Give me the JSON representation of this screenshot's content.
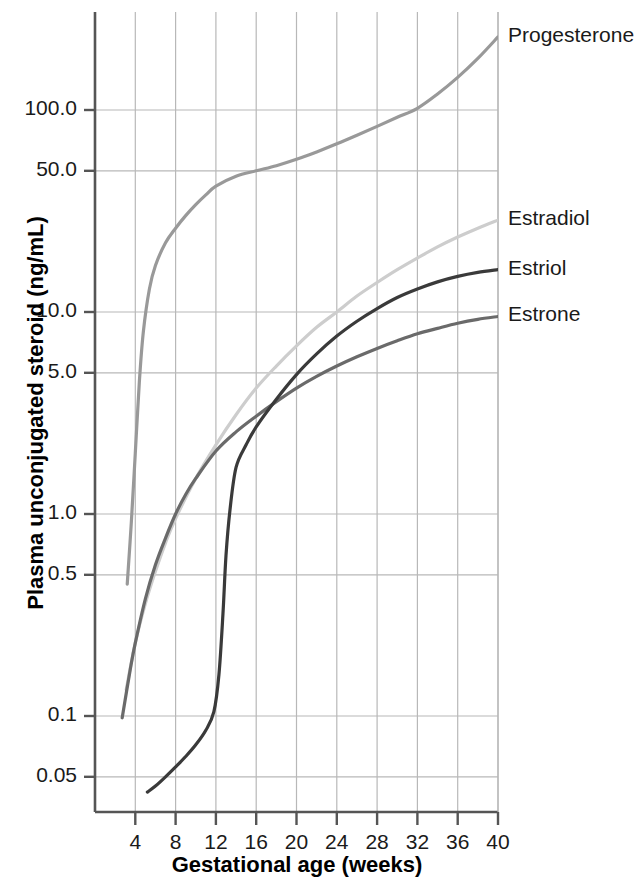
{
  "chart_data": {
    "type": "line",
    "title": "",
    "xlabel": "Gestational age (weeks)",
    "ylabel": "Plasma unconjugated steroid (ng/mL)",
    "xlim": [
      0,
      40
    ],
    "ylim": [
      0.04,
      300
    ],
    "yscale": "log",
    "xscale": "linear",
    "grid": true,
    "legend_position": "right-inline",
    "xticks": [
      4,
      8,
      12,
      16,
      20,
      24,
      28,
      32,
      36,
      40
    ],
    "xtick_labels": [
      "4",
      "8",
      "12",
      "16",
      "20",
      "24",
      "28",
      "32",
      "36",
      "40"
    ],
    "yticks": [
      0.05,
      0.1,
      0.5,
      1.0,
      5.0,
      10.0,
      50.0,
      100.0
    ],
    "ytick_labels": [
      "0.05",
      "0.1",
      "0.5",
      "1.0",
      "5.0",
      "10.0",
      "50.0",
      "100.0"
    ],
    "series": [
      {
        "name": "Progesterone",
        "color": "#999999",
        "label_value": "Progesterone",
        "x": [
          3.2,
          3.6,
          4.0,
          4.4,
          4.8,
          5.4,
          6.0,
          7.0,
          8.0,
          9.0,
          10.0,
          11.0,
          12.0,
          14.0,
          16.0,
          18.0,
          20.0,
          22.0,
          24.0,
          26.0,
          28.0,
          30.0,
          32.0,
          34.0,
          36.0,
          38.0,
          40.0
        ],
        "y": [
          0.45,
          0.9,
          2.0,
          4.5,
          8.0,
          13.0,
          17.0,
          22.0,
          26.0,
          30.0,
          34.0,
          38.0,
          42.0,
          47.0,
          50.0,
          53.0,
          57.0,
          62.0,
          68.0,
          75.0,
          83.0,
          92.0,
          102.0,
          120.0,
          145.0,
          180.0,
          230.0
        ]
      },
      {
        "name": "Estradiol",
        "color": "#cdcdcd",
        "label_value": "Estradiol",
        "x": [
          3.1,
          4.0,
          5.0,
          6.0,
          7.0,
          8.0,
          10.0,
          12.0,
          14.0,
          16.0,
          18.0,
          20.0,
          22.0,
          24.0,
          26.0,
          28.0,
          30.0,
          32.0,
          34.0,
          36.0,
          38.0,
          40.0
        ],
        "y": [
          0.135,
          0.23,
          0.36,
          0.52,
          0.72,
          0.95,
          1.5,
          2.2,
          3.1,
          4.2,
          5.4,
          6.8,
          8.4,
          10.0,
          12.0,
          14.0,
          16.2,
          18.5,
          21.0,
          23.5,
          26.0,
          28.5
        ]
      },
      {
        "name": "Estriol",
        "color": "#3a3a3a",
        "label_value": "Estriol",
        "x": [
          5.2,
          6.0,
          7.0,
          8.0,
          9.0,
          10.0,
          11.0,
          11.8,
          12.3,
          12.7,
          13.0,
          13.4,
          14.0,
          15.0,
          16.0,
          18.0,
          20.0,
          22.0,
          24.0,
          26.0,
          28.0,
          30.0,
          32.0,
          34.0,
          36.0,
          38.0,
          40.0
        ],
        "y": [
          0.042,
          0.045,
          0.05,
          0.056,
          0.063,
          0.072,
          0.085,
          0.105,
          0.16,
          0.32,
          0.62,
          1.05,
          1.7,
          2.2,
          2.7,
          3.7,
          4.9,
          6.2,
          7.6,
          9.0,
          10.4,
          11.8,
          13.0,
          14.1,
          15.0,
          15.7,
          16.2
        ]
      },
      {
        "name": "Estrone",
        "color": "#6a6a6a",
        "label_value": "Estrone",
        "x": [
          2.7,
          3.5,
          4.0,
          5.0,
          6.0,
          7.0,
          8.0,
          9.0,
          10.0,
          12.0,
          14.0,
          16.0,
          18.0,
          20.0,
          22.0,
          24.0,
          26.0,
          28.0,
          30.0,
          32.0,
          34.0,
          36.0,
          38.0,
          40.0
        ],
        "y": [
          0.098,
          0.17,
          0.23,
          0.38,
          0.56,
          0.76,
          1.0,
          1.25,
          1.5,
          2.05,
          2.55,
          3.05,
          3.6,
          4.2,
          4.8,
          5.4,
          6.0,
          6.6,
          7.2,
          7.8,
          8.3,
          8.8,
          9.2,
          9.5
        ]
      }
    ],
    "annotations": [
      {
        "text": "Progesterone",
        "x": 40,
        "y": 230,
        "anchor": "left"
      },
      {
        "text": "Estradiol",
        "x": 40,
        "y": 28.5,
        "anchor": "left"
      },
      {
        "text": "Estriol",
        "x": 40,
        "y": 16.2,
        "anchor": "left"
      },
      {
        "text": "Estrone",
        "x": 40,
        "y": 9.5,
        "anchor": "left"
      }
    ],
    "colors": {
      "axis": "#555555",
      "grid": "#b8b8b8",
      "background": "#ffffff",
      "text": "#1a1a1a"
    }
  }
}
